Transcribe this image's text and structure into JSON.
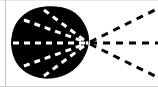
{
  "figure": {
    "title": "Dark blob with converging white dashed rays and radiating black dashed rays",
    "canvas": {
      "width": 158,
      "height": 87,
      "background_color": "#ffffff"
    },
    "colors": {
      "ink": "#000000",
      "paper": "#ffffff",
      "dash_light": "#ffffff",
      "scan_line_left": "#b9b9b9",
      "scan_line_bottom": "#cfcfcf",
      "scan_line_top": "#e8e8e8"
    },
    "focal_point": {
      "label": "focal-point",
      "x": 88,
      "y": 43
    },
    "blob": {
      "label": "dark-blob",
      "fill": "#000000",
      "bounds": {
        "x": 12,
        "y": 7,
        "width": 78,
        "height": 71
      },
      "path": "M 88 43 C 90 36 86 26 80 18 C 72 8 58 6 45 7 C 30 8 18 17 14 29 C 10 40 11 53 17 63 C 24 74 38 79 51 78 C 64 77 76 70 82 60 C 86 53 88 48 88 43 Z"
    },
    "inner_dashes": {
      "label": "white-converging-dashes",
      "stroke": "#ffffff",
      "stroke_width": 3,
      "dash_pattern": "6 5",
      "rays": [
        {
          "name": "inner-ray-upper-outer",
          "x1": 44,
          "y1": 10,
          "x2": 88,
          "y2": 43
        },
        {
          "name": "inner-ray-upper-inner",
          "x1": 24,
          "y1": 20,
          "x2": 88,
          "y2": 43
        },
        {
          "name": "inner-ray-center",
          "x1": 2,
          "y1": 43,
          "x2": 88,
          "y2": 43
        },
        {
          "name": "inner-ray-lower-inner",
          "x1": 24,
          "y1": 66,
          "x2": 88,
          "y2": 43
        },
        {
          "name": "inner-ray-lower-outer",
          "x1": 44,
          "y1": 76,
          "x2": 88,
          "y2": 43
        }
      ]
    },
    "outer_dashes": {
      "label": "black-radiating-dashes",
      "stroke": "#000000",
      "stroke_width": 3,
      "dash_pattern": "7 6",
      "rays": [
        {
          "name": "outer-ray-upper",
          "x1": 90,
          "y1": 42,
          "x2": 157,
          "y2": 9
        },
        {
          "name": "outer-ray-center",
          "x1": 90,
          "y1": 43,
          "x2": 158,
          "y2": 43
        },
        {
          "name": "outer-ray-lower",
          "x1": 90,
          "y1": 44,
          "x2": 157,
          "y2": 77
        }
      ]
    },
    "scan_artifacts": {
      "left_line_label": "scan-edge-left",
      "bottom_line_label": "scan-edge-bottom",
      "top_line_label": "scan-edge-top"
    }
  }
}
